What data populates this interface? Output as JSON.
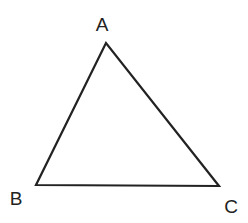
{
  "diagram": {
    "type": "triangle",
    "stroke_color": "#222222",
    "stroke_width": 2.2,
    "vertices": [
      {
        "name": "A",
        "x": 106,
        "y": 43,
        "label": "A",
        "label_x": 102,
        "label_y": 31
      },
      {
        "name": "B",
        "x": 36,
        "y": 185,
        "label": "B",
        "label_x": 16,
        "label_y": 205
      },
      {
        "name": "C",
        "x": 219,
        "y": 186,
        "label": "C",
        "label_x": 231,
        "label_y": 213
      }
    ]
  }
}
